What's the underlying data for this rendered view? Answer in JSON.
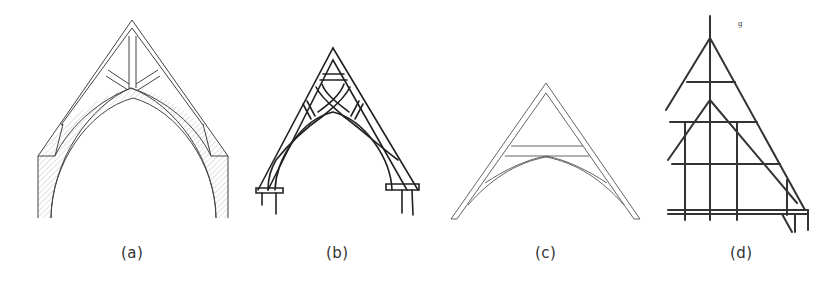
{
  "figure": {
    "panels": [
      {
        "id": "a",
        "label": "(a)",
        "description": "Gothic pointed arch roof truss with king post, struts and curved arch brace on hatched masonry"
      },
      {
        "id": "b",
        "label": "(b)",
        "description": "Hand-drawn scissor-braced truss with curved crossing braces on wall plates"
      },
      {
        "id": "c",
        "label": "(c)",
        "description": "Collar-beam truss with curved arched braces"
      },
      {
        "id": "d",
        "label": "(d)",
        "description": "Half-timbered gable frame with rafters, collar beams and posts"
      }
    ],
    "colors": {
      "line": "#444444",
      "hatch": "#bbbbbb",
      "ink": "#222222",
      "caption": "#333333"
    }
  }
}
